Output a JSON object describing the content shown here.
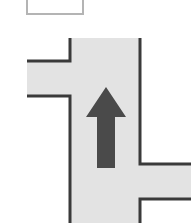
{
  "diagram": {
    "type": "road-intersection",
    "background_color": "#ffffff",
    "legend_box": {
      "label": "",
      "border_color": "#b4b4b4",
      "fill_color": "#ffffff",
      "x": 26,
      "y": -8,
      "width": 58,
      "height": 23
    },
    "road": {
      "fill_color": "#e3e3e3",
      "edge_color": "#3a3a3a",
      "edge_width": 3,
      "main_road": {
        "name": "vertical-main-road",
        "orientation": "vertical",
        "left_edge_x": 70,
        "right_edge_x": 141,
        "top_y": 38,
        "bottom_y": 223
      },
      "branches": [
        {
          "name": "left-branch",
          "side": "left",
          "orientation": "horizontal",
          "top_y": 61,
          "bottom_y": 96,
          "outer_x": 27,
          "inner_x": 70
        },
        {
          "name": "right-branch",
          "side": "right",
          "orientation": "horizontal",
          "top_y": 164,
          "bottom_y": 199,
          "inner_x": 141,
          "outer_x": 191
        }
      ]
    },
    "arrow": {
      "name": "direction-arrow",
      "direction": "up",
      "color": "#4a4a4a",
      "tip_y": 88,
      "tail_y": 168,
      "center_x": 106,
      "shaft_width": 18,
      "head_width": 40,
      "head_height": 30
    }
  }
}
